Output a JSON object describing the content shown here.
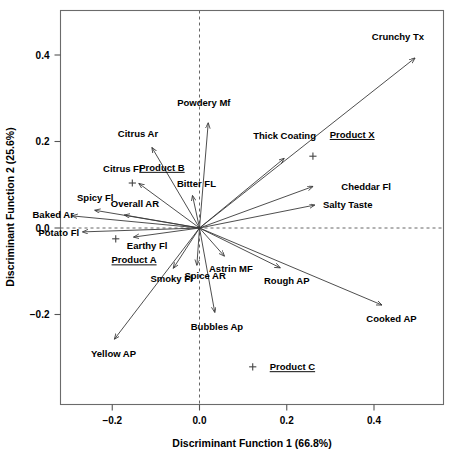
{
  "chart_data": {
    "type": "scatter",
    "title": "",
    "subtitle": "",
    "xlabel": "Discriminant Function 1 (66.8%)",
    "ylabel": "Discriminant Function 2 (25.6%)",
    "xlim": [
      -0.32,
      0.56
    ],
    "ylim": [
      -0.32,
      0.5
    ],
    "xticks": [
      -0.2,
      0.0,
      0.2,
      0.4
    ],
    "xtick_labels": [
      "−0.2",
      "0.0",
      "0.2",
      "0.4"
    ],
    "yticks": [
      -0.2,
      0.0,
      0.2,
      0.4
    ],
    "ytick_labels": [
      "−0.2",
      "0.0",
      "0.2",
      "0.4"
    ],
    "grid": false,
    "legend": "none",
    "reference_lines": {
      "vertical_at_x": 0.0,
      "horizontal_at_y": 0.0,
      "style": "dashed"
    },
    "origin": [
      0.0,
      0.0
    ],
    "vectors": [
      {
        "name": "Crunchy Tx",
        "x": 0.494,
        "y": 0.393,
        "label_x": 0.455,
        "label_y": 0.443,
        "anchor": "middle"
      },
      {
        "name": "Powdery Mf",
        "x": 0.02,
        "y": 0.243,
        "label_x": 0.01,
        "label_y": 0.29,
        "anchor": "middle"
      },
      {
        "name": "Thick Coating",
        "x": 0.194,
        "y": 0.161,
        "label_x": 0.195,
        "label_y": 0.213,
        "anchor": "middle"
      },
      {
        "name": "Citrus Ar",
        "x": -0.109,
        "y": 0.186,
        "label_x": -0.141,
        "label_y": 0.219,
        "anchor": "middle"
      },
      {
        "name": "Cheddar Fl",
        "x": 0.26,
        "y": 0.096,
        "label_x": 0.325,
        "label_y": 0.096,
        "anchor": "start"
      },
      {
        "name": "Citrus Fl",
        "x": -0.139,
        "y": 0.103,
        "label_x": -0.177,
        "label_y": 0.137,
        "anchor": "middle"
      },
      {
        "name": "Bitter FL",
        "x": -0.016,
        "y": 0.075,
        "label_x": -0.007,
        "label_y": 0.102,
        "anchor": "middle"
      },
      {
        "name": "Salty Taste",
        "x": 0.264,
        "y": 0.053,
        "label_x": 0.283,
        "label_y": 0.053,
        "anchor": "start"
      },
      {
        "name": "Spicy Fl",
        "x": -0.24,
        "y": 0.041,
        "label_x": -0.239,
        "label_y": 0.07,
        "anchor": "middle"
      },
      {
        "name": "Overall AR",
        "x": -0.172,
        "y": 0.03,
        "label_x": -0.148,
        "label_y": 0.056,
        "anchor": "middle"
      },
      {
        "name": "Baked Ar",
        "x": -0.292,
        "y": 0.028,
        "label_x": -0.288,
        "label_y": 0.032,
        "anchor": "end"
      },
      {
        "name": "Potato Fl",
        "x": -0.268,
        "y": -0.009,
        "label_x": -0.276,
        "label_y": -0.011,
        "anchor": "end"
      },
      {
        "name": "Earthy Fl",
        "x": -0.151,
        "y": -0.021,
        "label_x": -0.12,
        "label_y": -0.041,
        "anchor": "middle"
      },
      {
        "name": "Astrin MF",
        "x": 0.057,
        "y": -0.065,
        "label_x": 0.072,
        "label_y": -0.093,
        "anchor": "middle"
      },
      {
        "name": "Spice AR",
        "x": -0.006,
        "y": -0.086,
        "label_x": 0.013,
        "label_y": -0.109,
        "anchor": "middle"
      },
      {
        "name": "Smoky Fl",
        "x": -0.06,
        "y": -0.093,
        "label_x": -0.064,
        "label_y": -0.118,
        "anchor": "middle"
      },
      {
        "name": "Rough AP",
        "x": 0.185,
        "y": -0.092,
        "label_x": 0.2,
        "label_y": -0.122,
        "anchor": "middle"
      },
      {
        "name": "Cooked AP",
        "x": 0.418,
        "y": -0.178,
        "label_x": 0.44,
        "label_y": -0.21,
        "anchor": "middle"
      },
      {
        "name": "Bubbles Ap",
        "x": 0.035,
        "y": -0.195,
        "label_x": 0.04,
        "label_y": -0.228,
        "anchor": "middle"
      },
      {
        "name": "Yellow AP",
        "x": -0.195,
        "y": -0.257,
        "label_x": -0.197,
        "label_y": -0.29,
        "anchor": "middle"
      }
    ],
    "product_points": [
      {
        "name": "Product X",
        "x": 0.26,
        "y": 0.166,
        "label_x": 0.35,
        "label_y": 0.216,
        "marker": "plus"
      },
      {
        "name": "Product B",
        "x": -0.154,
        "y": 0.104,
        "label_x": -0.086,
        "label_y": 0.14,
        "marker": "plus"
      },
      {
        "name": "Product A",
        "x": -0.192,
        "y": -0.025,
        "label_x": -0.15,
        "label_y": -0.074,
        "marker": "plus"
      },
      {
        "name": "Product C",
        "x": 0.122,
        "y": -0.321,
        "label_x": 0.213,
        "label_y": -0.321,
        "marker": "plus"
      }
    ]
  },
  "axes": {
    "x_title": "Discriminant Function 1 (66.8%)",
    "y_title": "Discriminant Function 2 (25.6%)"
  }
}
